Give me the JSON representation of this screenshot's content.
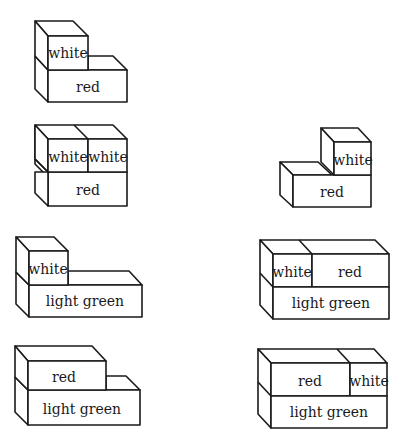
{
  "figures": [
    {
      "id": "fig-1",
      "blocks": [
        {
          "label": "white",
          "role": "top"
        },
        {
          "label": "red",
          "role": "bottom"
        }
      ]
    },
    {
      "id": "fig-2",
      "blocks": [
        {
          "label": "white",
          "role": "top-left"
        },
        {
          "label": "white",
          "role": "top-right"
        },
        {
          "label": "red",
          "role": "bottom"
        }
      ]
    },
    {
      "id": "fig-3",
      "blocks": [
        {
          "label": "white",
          "role": "top-right"
        },
        {
          "label": "red",
          "role": "bottom"
        }
      ]
    },
    {
      "id": "fig-4",
      "blocks": [
        {
          "label": "white",
          "role": "top-left"
        },
        {
          "label": "light green",
          "role": "bottom"
        }
      ]
    },
    {
      "id": "fig-5",
      "blocks": [
        {
          "label": "white",
          "role": "top-left"
        },
        {
          "label": "red",
          "role": "top-right"
        },
        {
          "label": "light green",
          "role": "bottom"
        }
      ]
    },
    {
      "id": "fig-6",
      "blocks": [
        {
          "label": "red",
          "role": "top-left"
        },
        {
          "label": "light green",
          "role": "bottom"
        }
      ]
    },
    {
      "id": "fig-7",
      "blocks": [
        {
          "label": "red",
          "role": "top-left"
        },
        {
          "label": "white",
          "role": "top-right"
        },
        {
          "label": "light green",
          "role": "bottom"
        }
      ]
    }
  ],
  "colors": {
    "line": "#1a1a1a",
    "background": "#ffffff"
  }
}
